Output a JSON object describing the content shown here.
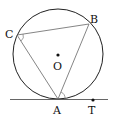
{
  "diagram": {
    "type": "circle-geometry",
    "circle": {
      "center_label": "O",
      "cx": 58,
      "cy": 54,
      "r": 45
    },
    "points": [
      {
        "label": "A",
        "x": 58,
        "y": 99
      },
      {
        "label": "B",
        "x": 89,
        "y": 22
      },
      {
        "label": "C",
        "x": 17,
        "y": 35
      },
      {
        "label": "O",
        "x": 58,
        "y": 54
      },
      {
        "label": "T",
        "x": 93,
        "y": 100
      }
    ],
    "segments": [
      "CB",
      "CA",
      "BA"
    ],
    "tangent_line": {
      "through": "A",
      "points_on": [
        "T"
      ]
    },
    "angle_marks": [
      "ACB",
      "BAT"
    ],
    "colors": {
      "stroke": "#222222",
      "chord": "#555555",
      "background": "#ffffff"
    }
  },
  "labels": {
    "A": "A",
    "B": "B",
    "C": "C",
    "O": "O",
    "T": "T"
  }
}
